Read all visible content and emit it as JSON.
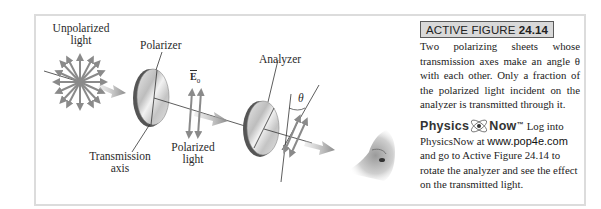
{
  "figure": {
    "labels": {
      "unpolarized_line1": "Unpolarized",
      "unpolarized_line2": "light",
      "polarizer": "Polarizer",
      "e0_symbol": "E",
      "e0_subscript": "0",
      "analyzer": "Analyzer",
      "theta": "θ",
      "polarized_line1": "Polarized",
      "polarized_line2": "light",
      "transmission_line1": "Transmission",
      "transmission_line2": "axis"
    }
  },
  "caption": {
    "tag_prefix": "ACTIVE FIGURE ",
    "tag_number": "24.14",
    "text": "Two polarizing sheets whose transmission axes make an angle θ with each other. Only a fraction of the polarized light incident on the analyzer is transmitted through it.",
    "brand_part1": "Physics",
    "brand_part2": "Now",
    "brand_tm": "™",
    "pn_text1": " Log into PhysicsNow at ",
    "pn_url": "www.pop4e.com",
    "pn_text2": " and go to Active Figure 24.14 to rotate the analyzer and see the effect on the transmitted light."
  },
  "colors": {
    "frame_border": "#dcdcdc",
    "tag_bg": "#d9d9d9",
    "arrow_gray": "#8a8a8a",
    "text": "#222222"
  }
}
